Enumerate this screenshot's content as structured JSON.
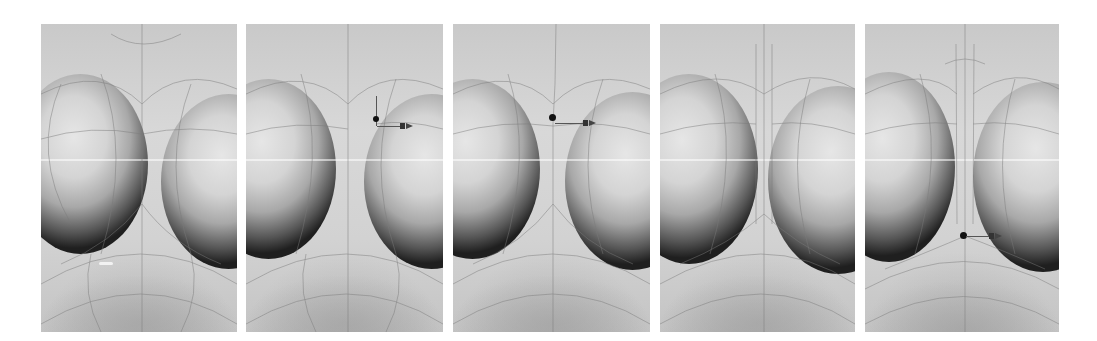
{
  "figure": {
    "background": "#ffffff",
    "panels": [
      {
        "index": 1,
        "gizmo": "none",
        "cursor_marker": true,
        "gap_style": "wide"
      },
      {
        "index": 2,
        "gizmo": "move-x",
        "gizmo_position": "right-blob-edge",
        "cursor_marker": false,
        "gap_style": "wide"
      },
      {
        "index": 3,
        "gizmo": "move-x",
        "gizmo_position": "center-top",
        "cursor_marker": false,
        "gap_style": "narrowing"
      },
      {
        "index": 4,
        "gizmo": "none",
        "cursor_marker": false,
        "gap_style": "narrow-channel"
      },
      {
        "index": 5,
        "gizmo": "move-x",
        "gizmo_position": "center-bottom",
        "cursor_marker": false,
        "gap_style": "narrow-channel"
      }
    ],
    "colors": {
      "surface_light": "#d8d8d8",
      "surface_dark": "#1f1f1f",
      "wireframe": "#7a7a7a",
      "gizmo": "#111111"
    }
  }
}
